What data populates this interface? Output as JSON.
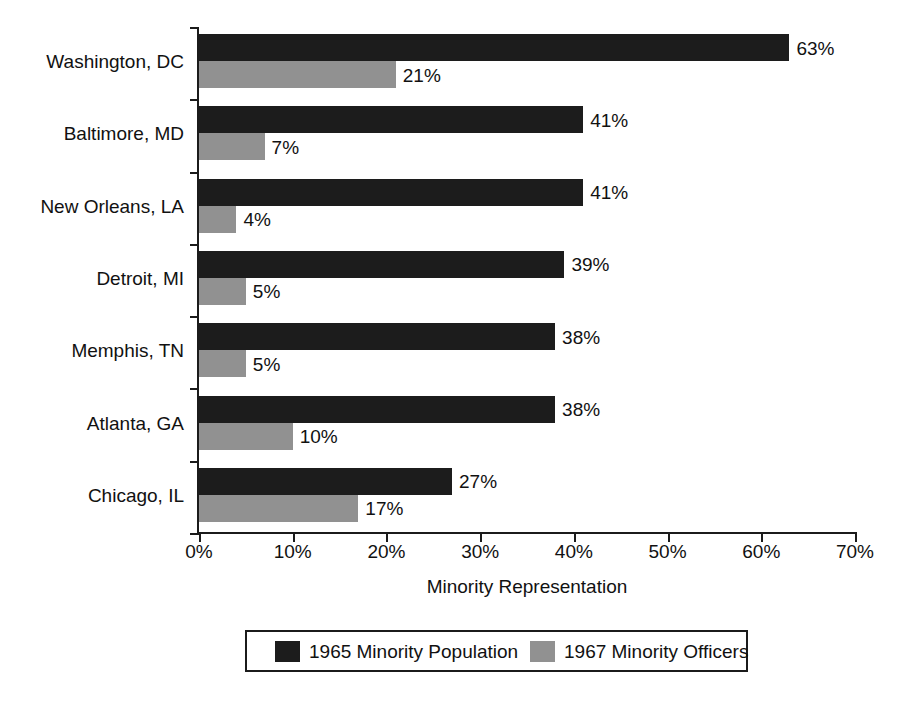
{
  "chart_data": {
    "type": "bar",
    "orientation": "horizontal",
    "title": "",
    "xlabel": "Minority Representation",
    "ylabel": "",
    "xlim": [
      0,
      70
    ],
    "grid": false,
    "legend_position": "bottom",
    "xtick_labels": [
      "0%",
      "10%",
      "20%",
      "30%",
      "40%",
      "50%",
      "60%",
      "70%"
    ],
    "xtick_values": [
      0,
      10,
      20,
      30,
      40,
      50,
      60,
      70
    ],
    "categories": [
      "Washington, DC",
      "Baltimore, MD",
      "New Orleans, LA",
      "Detroit, MI",
      "Memphis, TN",
      "Atlanta, GA",
      "Chicago, IL"
    ],
    "series": [
      {
        "name": "1965 Minority Population",
        "color": "#1c1c1c",
        "values": [
          63,
          41,
          41,
          39,
          38,
          38,
          27
        ],
        "labels": [
          "63%",
          "41%",
          "41%",
          "39%",
          "38%",
          "38%",
          "27%"
        ]
      },
      {
        "name": "1967 Minority Officers",
        "color": "#919191",
        "values": [
          21,
          7,
          4,
          5,
          5,
          10,
          17
        ],
        "labels": [
          "21%",
          "7%",
          "4%",
          "5%",
          "5%",
          "10%",
          "17%"
        ]
      }
    ]
  }
}
